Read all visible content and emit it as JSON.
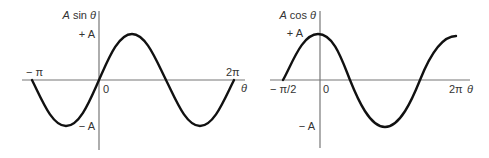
{
  "colors": {
    "curve": "#111111",
    "axis": "#777777",
    "text": "#333333",
    "background": "#ffffff"
  },
  "left_graph": {
    "y_axis_label": "A sin θ",
    "x_axis_label": "θ",
    "tick_plus": "+ A",
    "tick_minus": "− A",
    "origin": "0",
    "x_left": "− π",
    "x_right": "2π",
    "function": "A sin θ",
    "domain": [
      "-π",
      "2π"
    ]
  },
  "right_graph": {
    "y_axis_label": "A cos θ",
    "x_axis_label": "θ",
    "tick_plus": "+ A",
    "tick_minus": "− A",
    "origin": "0",
    "x_left": "− π/2",
    "x_right": "2π",
    "function": "A cos θ",
    "domain": [
      "-π/2",
      "2π"
    ]
  }
}
